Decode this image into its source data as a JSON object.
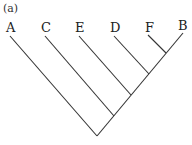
{
  "figure": {
    "panel_label": "(a)",
    "type": "cladogram",
    "taxa": [
      "A",
      "C",
      "E",
      "D",
      "F",
      "B"
    ],
    "topology": "(A,(C,(E,(D,(F,B)))))",
    "colors": {
      "line": "#333333",
      "text": "#222222",
      "background": "#ffffff"
    }
  }
}
